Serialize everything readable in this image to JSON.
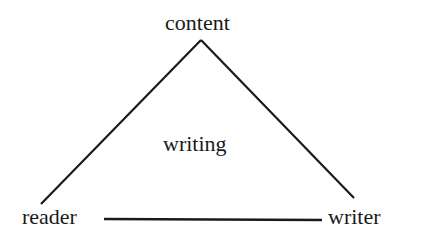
{
  "diagram": {
    "title": "",
    "nodes": {
      "top": "content",
      "left": "reader",
      "right": "writer",
      "center": "writing"
    },
    "edges": [
      {
        "from": "content",
        "to": "reader"
      },
      {
        "from": "content",
        "to": "writer"
      },
      {
        "from": "reader",
        "to": "writer"
      }
    ],
    "line_color": "#1a1a1a",
    "text_color": "#1a1a1a"
  }
}
